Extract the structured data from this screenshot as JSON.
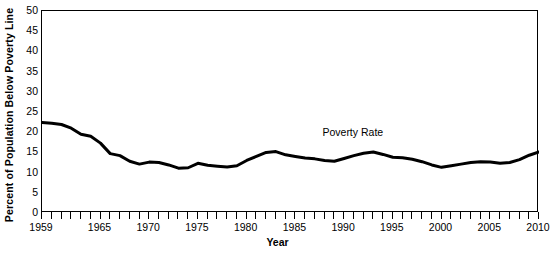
{
  "chart_data": {
    "type": "line",
    "title": "",
    "xlabel": "Year",
    "ylabel": "Percent of Population Below Poverty Line",
    "xlim": [
      1959,
      2010
    ],
    "ylim": [
      0,
      50
    ],
    "ytick_step": 5,
    "xtick_step": 1,
    "grid": false,
    "legend": "none",
    "annotations": [
      {
        "text": "Poverty Rate",
        "x": 1991.0,
        "y": 19.8
      }
    ],
    "xticklabels": [
      "1959",
      "1965",
      "1970",
      "1975",
      "1980",
      "1985",
      "1990",
      "1995",
      "2000",
      "2005",
      "2010"
    ],
    "xticklabel_values": [
      1959,
      1965,
      1970,
      1975,
      1980,
      1985,
      1990,
      1995,
      2000,
      2005,
      2010
    ],
    "yticklabels": [
      "0",
      "5",
      "10",
      "15",
      "20",
      "25",
      "30",
      "35",
      "40",
      "45",
      "50"
    ],
    "yticklabel_values": [
      0,
      5,
      10,
      15,
      20,
      25,
      30,
      35,
      40,
      45,
      50
    ],
    "series": [
      {
        "name": "Poverty Rate",
        "color": "#000000",
        "linewidth": 3,
        "x": [
          1959,
          1960,
          1961,
          1962,
          1963,
          1964,
          1965,
          1966,
          1967,
          1968,
          1969,
          1970,
          1971,
          1972,
          1973,
          1974,
          1975,
          1976,
          1977,
          1978,
          1979,
          1980,
          1981,
          1982,
          1983,
          1984,
          1985,
          1986,
          1987,
          1988,
          1989,
          1990,
          1991,
          1992,
          1993,
          1994,
          1995,
          1996,
          1997,
          1998,
          1999,
          2000,
          2001,
          2002,
          2003,
          2004,
          2005,
          2006,
          2007,
          2008,
          2009,
          2010
        ],
        "values": [
          22.4,
          22.2,
          21.9,
          21.0,
          19.5,
          19.0,
          17.3,
          14.7,
          14.2,
          12.8,
          12.1,
          12.6,
          12.5,
          11.9,
          11.1,
          11.2,
          12.3,
          11.8,
          11.6,
          11.4,
          11.7,
          13.0,
          14.0,
          15.0,
          15.2,
          14.4,
          14.0,
          13.6,
          13.4,
          13.0,
          12.8,
          13.5,
          14.2,
          14.8,
          15.1,
          14.5,
          13.8,
          13.7,
          13.3,
          12.7,
          11.9,
          11.3,
          11.7,
          12.1,
          12.5,
          12.7,
          12.6,
          12.3,
          12.5,
          13.2,
          14.3,
          15.1
        ]
      }
    ]
  }
}
